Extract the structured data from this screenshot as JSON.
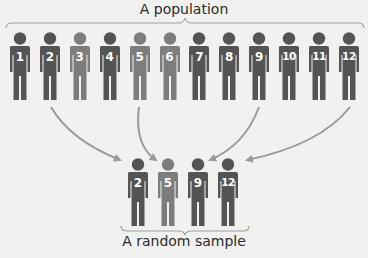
{
  "labels": {
    "population": "A population",
    "sample": "A random sample"
  },
  "colors": {
    "background": "#f1f1f0",
    "dark_figure": "#545454",
    "light_figure": "#7d7d7d",
    "arrow": "#9a9a9a",
    "brace": "#a0a0a0",
    "text": "#2a2a2a"
  },
  "population": [
    {
      "id": "1",
      "shade": "dark"
    },
    {
      "id": "2",
      "shade": "dark"
    },
    {
      "id": "3",
      "shade": "light"
    },
    {
      "id": "4",
      "shade": "dark"
    },
    {
      "id": "5",
      "shade": "light"
    },
    {
      "id": "6",
      "shade": "light"
    },
    {
      "id": "7",
      "shade": "dark"
    },
    {
      "id": "8",
      "shade": "dark"
    },
    {
      "id": "9",
      "shade": "dark"
    },
    {
      "id": "10",
      "shade": "dark"
    },
    {
      "id": "11",
      "shade": "dark"
    },
    {
      "id": "12",
      "shade": "dark"
    }
  ],
  "sample": [
    {
      "id": "2",
      "shade": "dark"
    },
    {
      "id": "5",
      "shade": "light"
    },
    {
      "id": "9",
      "shade": "dark"
    },
    {
      "id": "12",
      "shade": "dark"
    }
  ],
  "arrows": [
    {
      "from": "2",
      "to": "2"
    },
    {
      "from": "5",
      "to": "5"
    },
    {
      "from": "9",
      "to": "9"
    },
    {
      "from": "12",
      "to": "12"
    }
  ]
}
